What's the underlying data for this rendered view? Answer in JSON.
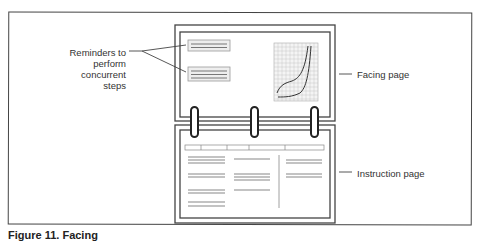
{
  "figure": {
    "caption": "Figure 11. Facing",
    "callouts": {
      "reminders": "Reminders to perform concurrent steps",
      "reminders_lines": [
        "Reminders to",
        "perform",
        "concurrent steps"
      ],
      "facing_page": "Facing page",
      "instruction_page": "Instruction page"
    },
    "parts": {
      "facing_page": {
        "reminder_boxes": 2,
        "graph": "grid-with-two-curves"
      },
      "binder_rings": 3,
      "instruction_page": {
        "header_cells": 5,
        "columns": 3
      }
    },
    "colors": {
      "line": "#444444",
      "text": "#333333",
      "grid": "#bbbbbb",
      "text_bars": "#888888"
    }
  }
}
